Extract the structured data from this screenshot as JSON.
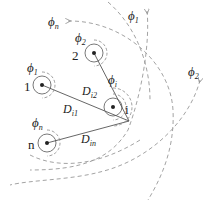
{
  "diagram": {
    "nodes": [
      {
        "id": "1",
        "label": "1",
        "flux": "ϕ",
        "flux_sub": "1"
      },
      {
        "id": "2",
        "label": "2",
        "flux": "ϕ",
        "flux_sub": "2"
      },
      {
        "id": "i",
        "label": "i",
        "flux": "ϕ",
        "flux_sub": "i"
      },
      {
        "id": "n",
        "label": "n",
        "flux": "ϕ",
        "flux_sub": "n"
      }
    ],
    "edges": [
      {
        "from": "i",
        "to": "1",
        "label": "D",
        "label_sub": "i1"
      },
      {
        "from": "i",
        "to": "2",
        "label": "D",
        "label_sub": "i2"
      },
      {
        "from": "i",
        "to": "n",
        "label": "D",
        "label_sub": "in"
      }
    ],
    "far_field_labels": [
      {
        "symbol": "ϕ",
        "sub": "n"
      },
      {
        "symbol": "ϕ",
        "sub": "1"
      },
      {
        "symbol": "ϕ",
        "sub": "2"
      }
    ],
    "colors": {
      "line": "#555555",
      "dash": "#888888",
      "text": "#222222"
    }
  }
}
